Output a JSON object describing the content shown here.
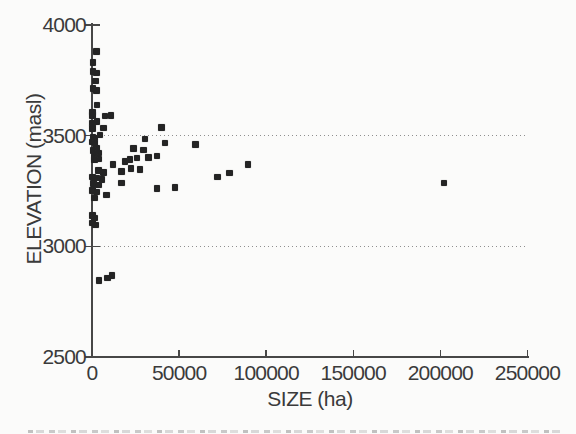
{
  "figure": {
    "background_color": "#fbfbfa",
    "marker_color": "#242424",
    "axis_color": "#474747",
    "text_color": "#3a3a3a",
    "gridline_color": "#8f8f8f"
  },
  "chart_data": {
    "type": "scatter",
    "title": "",
    "xlabel": "SIZE (ha)",
    "ylabel": "ELEVATION (masl)",
    "xlim": [
      0,
      250000
    ],
    "ylim": [
      2500,
      4000
    ],
    "xticks": [
      0,
      50000,
      100000,
      150000,
      200000,
      250000
    ],
    "xtick_labels": [
      "0",
      "50000",
      "100000",
      "150000",
      "200000",
      "250000"
    ],
    "yticks": [
      2500,
      3000,
      3500,
      4000
    ],
    "ytick_labels": [
      "2500",
      "3000",
      "3500",
      "4000"
    ],
    "gridlines_y": [
      3000,
      3500
    ],
    "gridline_style": "dotted",
    "grid": "horizontal-dotted",
    "legend": null,
    "marker": "filled-square",
    "points": [
      [
        2500,
        3880
      ],
      [
        600,
        3830
      ],
      [
        700,
        3790
      ],
      [
        2600,
        3784
      ],
      [
        2100,
        3747
      ],
      [
        700,
        3714
      ],
      [
        2700,
        3705
      ],
      [
        2900,
        3638
      ],
      [
        300,
        3606
      ],
      [
        400,
        3591
      ],
      [
        7600,
        3588
      ],
      [
        11000,
        3592
      ],
      [
        2800,
        3563
      ],
      [
        300,
        3557
      ],
      [
        6600,
        3535
      ],
      [
        300,
        3533
      ],
      [
        4700,
        3502
      ],
      [
        500,
        3494
      ],
      [
        1800,
        3489
      ],
      [
        300,
        3471
      ],
      [
        1700,
        3467
      ],
      [
        2700,
        3443
      ],
      [
        500,
        3433
      ],
      [
        3600,
        3421
      ],
      [
        1400,
        3404
      ],
      [
        3600,
        3394
      ],
      [
        40000,
        3537
      ],
      [
        30500,
        3484
      ],
      [
        42000,
        3466
      ],
      [
        59500,
        3459
      ],
      [
        23700,
        3443
      ],
      [
        29500,
        3436
      ],
      [
        37200,
        3408
      ],
      [
        32400,
        3402
      ],
      [
        25700,
        3398
      ],
      [
        27600,
        3348
      ],
      [
        22500,
        3352
      ],
      [
        1300,
        3389
      ],
      [
        21800,
        3392
      ],
      [
        19000,
        3384
      ],
      [
        12200,
        3369
      ],
      [
        17000,
        3337
      ],
      [
        3600,
        3343
      ],
      [
        6500,
        3333
      ],
      [
        300,
        3313
      ],
      [
        2700,
        3308
      ],
      [
        5600,
        3302
      ],
      [
        800,
        3283
      ],
      [
        3600,
        3278
      ],
      [
        17000,
        3287
      ],
      [
        300,
        3252
      ],
      [
        2700,
        3245
      ],
      [
        8400,
        3233
      ],
      [
        1400,
        3218
      ],
      [
        37200,
        3262
      ],
      [
        47700,
        3266
      ],
      [
        72000,
        3313
      ],
      [
        79000,
        3331
      ],
      [
        89500,
        3369
      ],
      [
        202000,
        3286
      ],
      [
        300,
        3140
      ],
      [
        1300,
        3127
      ],
      [
        300,
        3105
      ],
      [
        2100,
        3096
      ],
      [
        4000,
        2846
      ],
      [
        9000,
        2856
      ],
      [
        11500,
        2868
      ]
    ]
  }
}
